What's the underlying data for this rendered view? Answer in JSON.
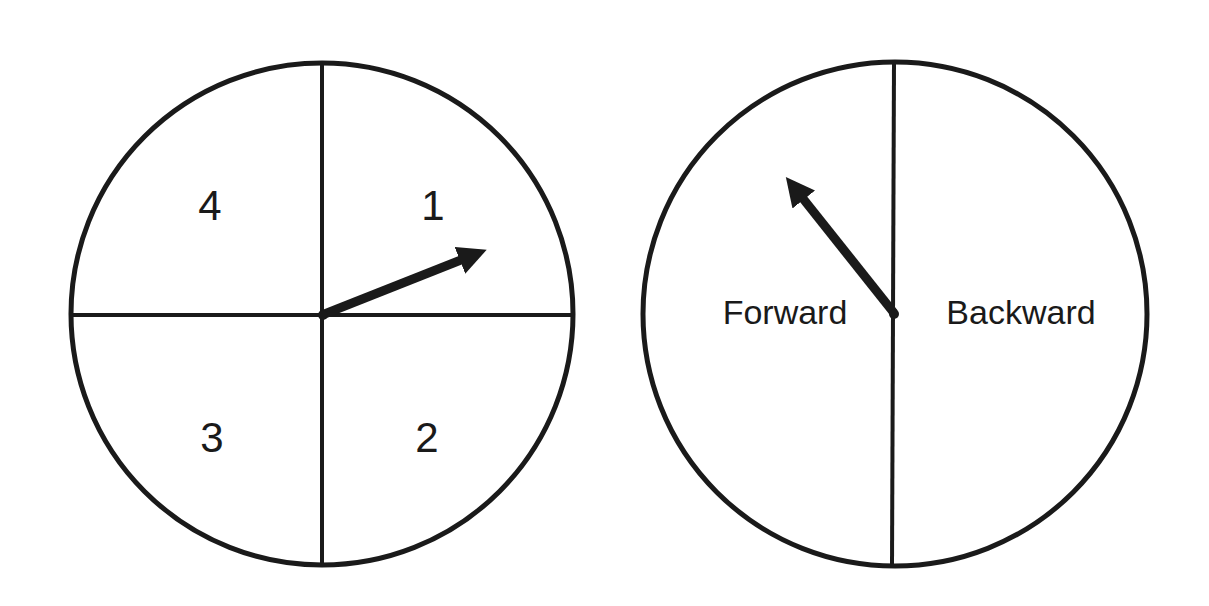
{
  "spinners": [
    {
      "name": "number-spinner",
      "sections": [
        "1",
        "2",
        "3",
        "4"
      ],
      "labels": {
        "q1": "1",
        "q2": "2",
        "q3": "3",
        "q4": "4"
      },
      "pointer_on": "1"
    },
    {
      "name": "direction-spinner",
      "sections": [
        "Forward",
        "Backward"
      ],
      "labels": {
        "left": "Forward",
        "right": "Backward"
      },
      "pointer_on": "Forward"
    }
  ],
  "colors": {
    "stroke": "#1a1a1a",
    "background": "#ffffff"
  }
}
